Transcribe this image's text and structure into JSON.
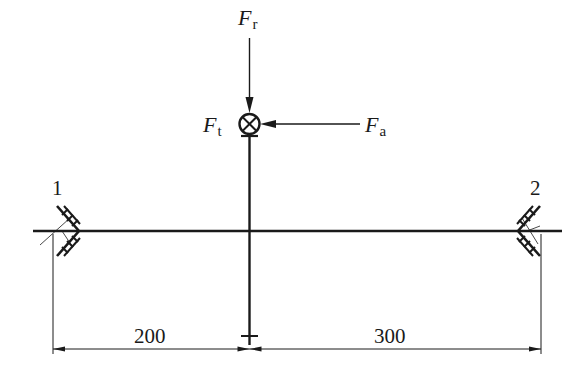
{
  "diagram": {
    "type": "shaft-force-diagram",
    "forces": {
      "radial": {
        "symbol": "F",
        "subscript": "r"
      },
      "tangential": {
        "symbol": "F",
        "subscript": "t"
      },
      "axial": {
        "symbol": "F",
        "subscript": "a"
      }
    },
    "bearings": [
      {
        "id": "1",
        "label": "1"
      },
      {
        "id": "2",
        "label": "2"
      }
    ],
    "dimensions": [
      {
        "label": "200"
      },
      {
        "label": "300"
      }
    ],
    "colors": {
      "line": "#1a1a1a",
      "background": "#ffffff"
    }
  }
}
